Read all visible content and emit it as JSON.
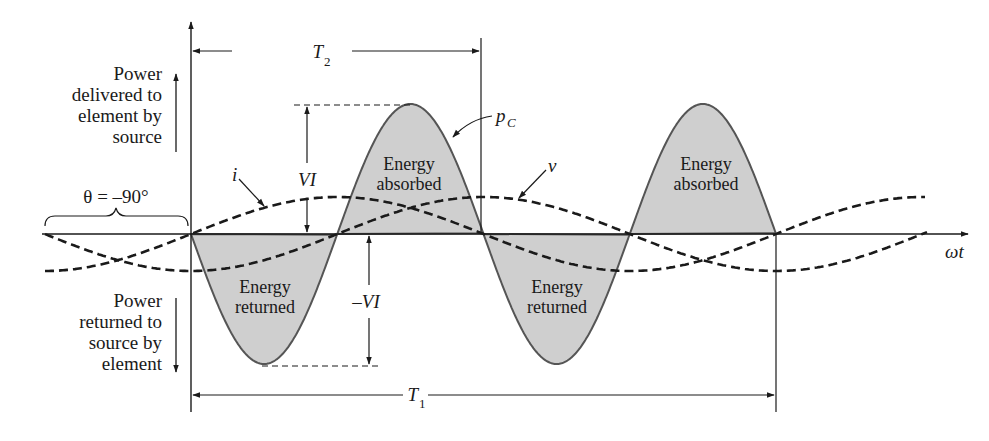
{
  "figure": {
    "colors": {
      "ink": "#1a1a1a",
      "fill": "#cfcfcf",
      "curve": "#555555"
    }
  },
  "labels": {
    "power_delivered": [
      "Power",
      "delivered to",
      "element by",
      "source"
    ],
    "power_returned": [
      "Power",
      "returned to",
      "source by",
      "element"
    ],
    "theta": "θ = –90°",
    "i": "i",
    "v": "v",
    "pc_main": "p",
    "pc_sub": "C",
    "vi_pos": "VI",
    "vi_neg": "–VI",
    "t1_main": "T",
    "t1_sub": "1",
    "t2_main": "T",
    "t2_sub": "2",
    "omega_t": "ωt",
    "energy_absorbed": [
      "Energy",
      "absorbed"
    ],
    "energy_returned": [
      "Energy",
      "returned"
    ]
  },
  "chart_data": {
    "type": "line",
    "title": "",
    "xlabel": "ωt",
    "ylabel": "",
    "grid": false,
    "series": [
      {
        "name": "i",
        "style": "dashed",
        "description": "current, leads v by 90°",
        "amplitude_rel": 0.28
      },
      {
        "name": "v",
        "style": "dashed",
        "description": "voltage",
        "amplitude_rel": 0.28
      },
      {
        "name": "p_C",
        "style": "solid-filled",
        "description": "instantaneous power, oscillates between VI and –VI at twice the frequency",
        "peak": "VI",
        "trough": "–VI"
      }
    ],
    "annotations": [
      "θ = –90°",
      "T2 = period of p_C",
      "T1 = period of v and i",
      "Energy absorbed (positive lobes)",
      "Energy returned (negative lobes)",
      "Power delivered to element by source (up)",
      "Power returned to source by element (down)"
    ],
    "power_lobes": [
      "returned",
      "absorbed",
      "returned",
      "absorbed"
    ]
  }
}
